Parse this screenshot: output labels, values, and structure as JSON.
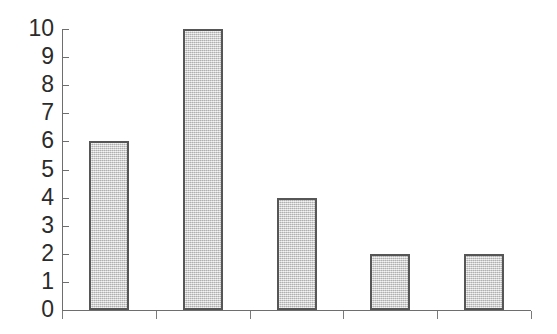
{
  "chart_data": {
    "type": "bar",
    "title": "",
    "subtitle": "",
    "xlabel": "",
    "ylabel": "",
    "categories": [
      "1",
      "2",
      "3",
      "4",
      "5"
    ],
    "values": [
      6,
      10,
      4,
      2,
      2
    ],
    "series": [
      {
        "name": "",
        "values": [
          6,
          10,
          4,
          2,
          2
        ]
      }
    ],
    "ylim": [
      0,
      10
    ],
    "y_ticks": [
      0,
      1,
      2,
      3,
      4,
      5,
      6,
      7,
      8,
      9,
      10
    ],
    "y_tick_labels": [
      "0",
      "1",
      "2",
      "3",
      "4",
      "5",
      "6",
      "7",
      "8",
      "9",
      "10"
    ],
    "x_tick_labels": [
      "",
      "",
      "",
      "",
      "",
      ""
    ],
    "grid": false,
    "legend": false,
    "legend_position": "none",
    "annotations": [],
    "colors": {
      "background": "#ffffff",
      "bar_fill": "#c9c9c9",
      "bar_border": "#565656",
      "axis": "#6e6e6e",
      "tick_label": "#2b2b2b"
    }
  },
  "axis": {
    "y_labels": [
      {
        "text": "10",
        "value": 10
      },
      {
        "text": "9",
        "value": 9
      },
      {
        "text": "8",
        "value": 8
      },
      {
        "text": "7",
        "value": 7
      },
      {
        "text": "6",
        "value": 6
      },
      {
        "text": "5",
        "value": 5
      },
      {
        "text": "4",
        "value": 4
      },
      {
        "text": "3",
        "value": 3
      },
      {
        "text": "2",
        "value": 2
      },
      {
        "text": "1",
        "value": 1
      },
      {
        "text": "0",
        "value": 0
      }
    ]
  }
}
